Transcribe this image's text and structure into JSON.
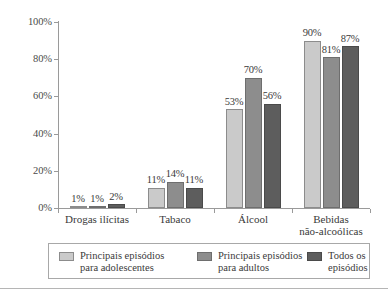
{
  "chart_data": {
    "type": "bar",
    "title": "",
    "subtitle": "",
    "xlabel": "",
    "ylabel": "",
    "ylim": [
      0,
      100
    ],
    "yticks": [
      "0%",
      "20%",
      "40%",
      "60%",
      "80%",
      "100%"
    ],
    "ytick_values": [
      0,
      20,
      40,
      60,
      80,
      100
    ],
    "grid": false,
    "legend_position": "bottom",
    "value_suffix": "%",
    "categories": [
      "Drogas ilícitas",
      "Tabaco",
      "Álcool",
      "Bebidas\nnão-alcoólicas"
    ],
    "series": [
      {
        "name": "Principais episódios\npara adolescentes",
        "color": "#cacaca",
        "values": [
          1,
          11,
          53,
          90
        ],
        "labels": [
          "1%",
          "11%",
          "53%",
          "90%"
        ]
      },
      {
        "name": "Principais episódios\npara adultos",
        "color": "#8d8d8d",
        "values": [
          1,
          14,
          70,
          81
        ],
        "labels": [
          "1%",
          "14%",
          "70%",
          "81%"
        ]
      },
      {
        "name": "Todos os\nepisódios",
        "color": "#5d5d5d",
        "values": [
          2,
          11,
          56,
          87
        ],
        "labels": [
          "2%",
          "11%",
          "56%",
          "87%"
        ]
      }
    ]
  },
  "axis": {
    "y_labels": [
      "100%",
      "80%",
      "60%",
      "40%",
      "20%",
      "0%"
    ]
  },
  "legend": {
    "items": [
      {
        "label": "Principais episódios\npara adolescentes"
      },
      {
        "label": "Principais episódios\npara adultos"
      },
      {
        "label": "Todos os\nepisódios"
      }
    ]
  }
}
